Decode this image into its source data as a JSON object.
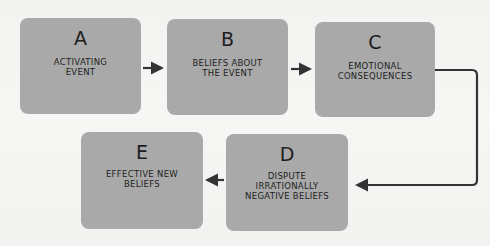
{
  "diagram": {
    "boxes": [
      {
        "id": "A",
        "letter": "A",
        "label": "ACTIVATING\nEVENT"
      },
      {
        "id": "B",
        "letter": "B",
        "label": "BELIEFS ABOUT\nTHE EVENT"
      },
      {
        "id": "C",
        "letter": "C",
        "label": "EMOTIONAL\nCONSEQUENCES"
      },
      {
        "id": "D",
        "letter": "D",
        "label": "DISPUTE\nIRRATIONALLY\nNEGATIVE BELIEFS"
      },
      {
        "id": "E",
        "letter": "E",
        "label": "EFFECTIVE NEW\nBELIEFS"
      }
    ],
    "edges": [
      {
        "from": "A",
        "to": "B"
      },
      {
        "from": "B",
        "to": "C"
      },
      {
        "from": "C",
        "to": "D"
      },
      {
        "from": "D",
        "to": "E"
      }
    ],
    "colors": {
      "box": "#a9a9a9",
      "arrow": "#333333",
      "text": "#1e1e1e",
      "background": "#f4f4f2"
    }
  }
}
